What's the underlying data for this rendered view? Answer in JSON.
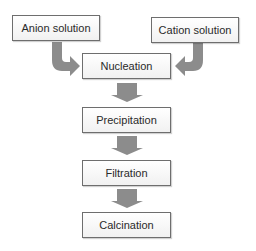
{
  "diagram": {
    "inputs": [
      {
        "label": "Anion solution"
      },
      {
        "label": "Cation solution"
      }
    ],
    "steps": [
      {
        "label": "Nucleation"
      },
      {
        "label": "Precipitation"
      },
      {
        "label": "Filtration"
      },
      {
        "label": "Calcination"
      }
    ],
    "colors": {
      "arrow_fill": "#8c8c8c",
      "box_border": "#6e6e6e",
      "text": "#2a2a2a"
    }
  }
}
